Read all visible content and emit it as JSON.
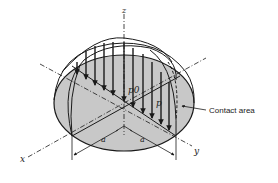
{
  "figure": {
    "labels": {
      "z_axis": "z",
      "x_axis": "x",
      "y_axis": "y",
      "peak_pressure": "p0",
      "pressure": "p",
      "semi_axis_left": "a",
      "semi_axis_right": "a",
      "contact_area": "Contact area"
    },
    "colors": {
      "contact_fill": "#c8c8c8",
      "line": "#1a1a1a",
      "background": "#ffffff"
    }
  }
}
